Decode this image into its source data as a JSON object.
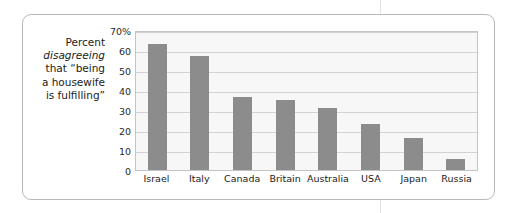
{
  "caption": {
    "lines": [
      {
        "text": "Percent",
        "italic": false
      },
      {
        "text": "disagreeing",
        "italic": true
      },
      {
        "text": "that “being",
        "italic": false
      },
      {
        "text": "a housewife",
        "italic": false
      },
      {
        "text": "is fulfilling”",
        "italic": false
      }
    ]
  },
  "colors": {
    "bar": "#8c8c8c",
    "plot_background": "#f7f7f7",
    "gridline": "#d2d2d2",
    "frame_border": "#b9b9b9",
    "text": "#1b1b1b"
  },
  "chart_data": {
    "type": "bar",
    "title": "",
    "subtitle": "",
    "xlabel": "",
    "ylabel": "Percent disagreeing that “being a housewife is fulfilling”",
    "categories": [
      "Israel",
      "Italy",
      "Canada",
      "Britain",
      "Australia",
      "USA",
      "Japan",
      "Russia"
    ],
    "values": [
      63,
      57,
      36.5,
      35,
      31,
      23,
      16,
      5.5
    ],
    "ylim": [
      0,
      70
    ],
    "ytick_values": [
      70,
      60,
      50,
      40,
      30,
      20,
      10,
      0
    ],
    "ytick_labels": [
      "70%",
      "60",
      "50",
      "40",
      "30",
      "20",
      "10",
      "0"
    ],
    "grid": true,
    "legend": "none"
  }
}
